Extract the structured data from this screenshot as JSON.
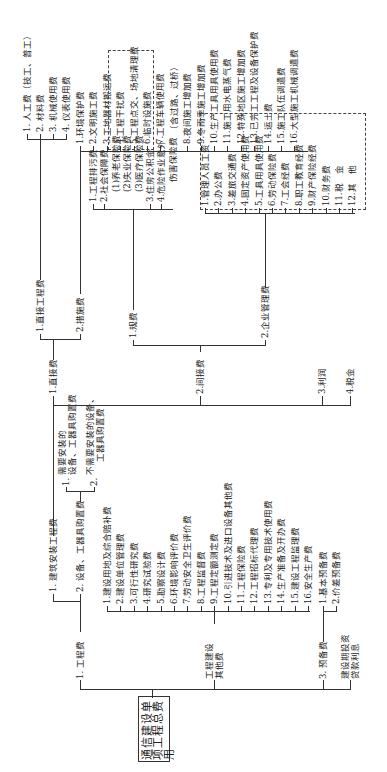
{
  "root": {
    "label": "通信建设单项工程总费用"
  },
  "level1": [
    {
      "label": "1. 工程费"
    },
    {
      "label": "2. 工程建设其他费",
      "line1": "工程建设",
      "line2": "其他费"
    },
    {
      "label": "3. 预备费"
    },
    {
      "label": "4. 建设期投资贷款利息",
      "line1": "建设期投资",
      "line2": "贷款利息"
    }
  ],
  "engineering": {
    "children": [
      {
        "label": "1. 建筑安装工程费"
      },
      {
        "label": "2. 设备、工器具购置费"
      }
    ],
    "equipment_children": [
      {
        "label": "1. 需要安装的设备、工器具购置费",
        "line1": "需要安装的",
        "line2": "设备、工器具购置费"
      },
      {
        "label": "2. 不需要安装的设备、工器具购置费",
        "line1": "不需要安装的设备、",
        "line2": "工器具购置费"
      }
    ]
  },
  "construction": {
    "children": [
      {
        "label": "1.直接费"
      },
      {
        "label": "2.间接费"
      },
      {
        "label": "3.利润"
      },
      {
        "label": "4.税金"
      }
    ]
  },
  "direct": {
    "children": [
      {
        "label": "1.直接工程费"
      },
      {
        "label": "2.措施费"
      }
    ],
    "direct_engineering_items": [
      {
        "label": "1. 人工费（技工、普工）"
      },
      {
        "label": "2. 材料费"
      },
      {
        "label": "3. 机械使用费"
      },
      {
        "label": "4. 仪表使用费"
      }
    ],
    "measures_items": [
      {
        "label": "1.环境保护费"
      },
      {
        "label": "2.文明施工费"
      },
      {
        "label": "3.工地器材搬运费"
      },
      {
        "label": "4.工程干扰费"
      },
      {
        "label": "5.工程点交、场地清理费"
      },
      {
        "label": "6.临时设施费"
      },
      {
        "label": "7.工程车辆使用费"
      },
      {
        "label": "（含过路、过桥）"
      },
      {
        "label": "8.夜间施工增加费"
      },
      {
        "label": "9.冬雨季施工增加费"
      },
      {
        "label": "10.生产工具用具使用费"
      },
      {
        "label": "11.施工用水电蒸气费"
      },
      {
        "label": "12.特殊地区施工增加费"
      },
      {
        "label": "13.已完工工程及设备保护费"
      },
      {
        "label": "14.运土费"
      },
      {
        "label": "15.施工队伍调遣费"
      },
      {
        "label": "16.大型施工机械调遣费"
      }
    ]
  },
  "indirect": {
    "children": [
      {
        "label": "1.规费"
      },
      {
        "label": "2.企业管理费"
      }
    ],
    "fees_items": [
      {
        "label": "1.工程排污费"
      },
      {
        "label": "2.社会保障费"
      },
      {
        "label": "(1)养老保险费"
      },
      {
        "label": "(2)失业保险费"
      },
      {
        "label": "(3)医疗保险费"
      },
      {
        "label": "3.住房公积金"
      },
      {
        "label": "4.危险作业意外"
      },
      {
        "label": "伤害保险费"
      }
    ],
    "management_items": [
      {
        "label": "1.管理人员工资"
      },
      {
        "label": "2.办公费"
      },
      {
        "label": "3.差旅交通费"
      },
      {
        "label": "4.固定资产使用费"
      },
      {
        "label": "5.工具用具使用费"
      },
      {
        "label": "6.劳动保险费"
      },
      {
        "label": "7.工会经费"
      },
      {
        "label": "8.职工教育经费"
      },
      {
        "label": "9.财产保险经费"
      },
      {
        "label": "10.财务费"
      },
      {
        "label": "11.税　金"
      },
      {
        "label": "12.其　他"
      }
    ]
  },
  "other_costs": {
    "items": [
      {
        "label": "1.建设用地及综合赔补费"
      },
      {
        "label": "2.建设单位管理费"
      },
      {
        "label": "3.可行性研究费"
      },
      {
        "label": "4.研究试验费"
      },
      {
        "label": "5.勘察设计费"
      },
      {
        "label": "6.环境影响评价费"
      },
      {
        "label": "7.劳动安全卫生评价费"
      },
      {
        "label": "8.工程监督费"
      },
      {
        "label": "9.工程定额测定费"
      },
      {
        "label": "10.引进技术及进口设备其他费"
      },
      {
        "label": "11.工程保险费"
      },
      {
        "label": "12.工程招标代理费"
      },
      {
        "label": "13.专利及专用技术使用费"
      },
      {
        "label": "14.生产准备及开办费"
      },
      {
        "label": "15.建设工程监理费"
      },
      {
        "label": "16.安全生产费"
      }
    ]
  },
  "reserve": {
    "items": [
      {
        "label": "1.基本预备费"
      },
      {
        "label": "2.价差预备费"
      }
    ]
  }
}
